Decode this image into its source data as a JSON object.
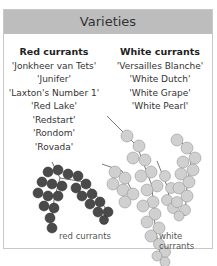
{
  "header": {
    "title": "Varieties"
  },
  "columns": [
    {
      "heading": "Red currants",
      "items": [
        "'Jonkheer van Tets'",
        "'Junifer'",
        "'Laxton's Number 1'",
        "'Red Lake'",
        "'Redstart'",
        "'Rondom'",
        "'Rovada'"
      ]
    },
    {
      "heading": "White currants",
      "items": [
        "'Versailles Blanche'",
        "'White Dutch'",
        "'White Grape'",
        "'White Pearl'"
      ]
    }
  ],
  "images": [
    {
      "name": "red-currants-photo",
      "caption": "red currants"
    },
    {
      "name": "white-currants-photo",
      "caption": "white currants"
    }
  ],
  "colors": {
    "header_bg": "#bdbdbd",
    "border": "#c8c8c8"
  }
}
